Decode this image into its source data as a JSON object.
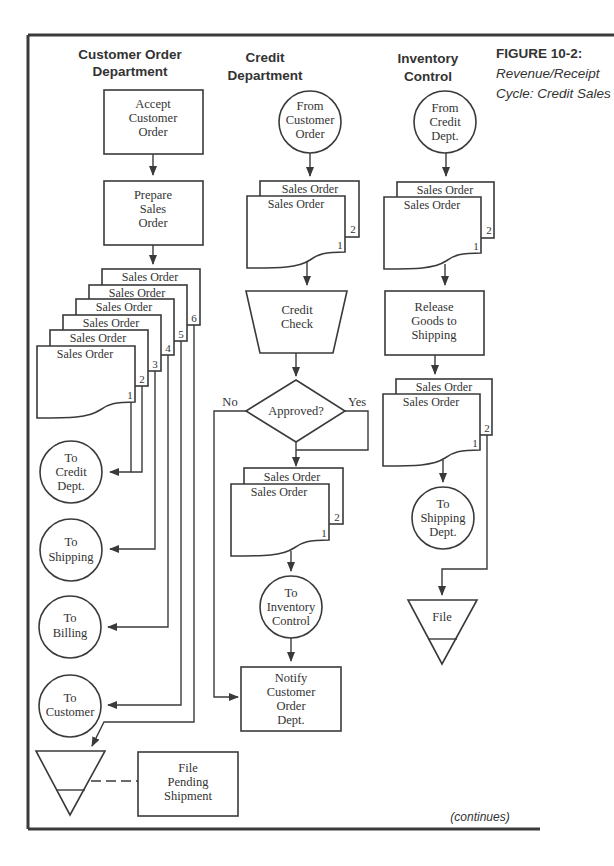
{
  "figure": {
    "number_label": "FIGURE  10-2:",
    "caption_line1": "Revenue/Receipt",
    "caption_line2": "Cycle: Credit Sales",
    "continues_label": "(continues)"
  },
  "columns": {
    "customer_order": {
      "heading_line1": "Customer Order",
      "heading_line2": "Department"
    },
    "credit": {
      "heading_line1": "Credit",
      "heading_line2": "Department"
    },
    "inventory": {
      "heading_line1": "Inventory",
      "heading_line2": "Control"
    }
  },
  "customer_order_dept": {
    "accept": [
      "Accept",
      "Customer",
      "Order"
    ],
    "prepare": [
      "Prepare",
      "Sales",
      "Order"
    ],
    "documents": {
      "label": "Sales Order",
      "copies": [
        "1",
        "2",
        "3",
        "4",
        "5",
        "6"
      ]
    },
    "to_credit": [
      "To",
      "Credit",
      "Dept."
    ],
    "to_shipping": [
      "To",
      "Shipping"
    ],
    "to_billing": [
      "To",
      "Billing"
    ],
    "to_customer": [
      "To",
      "Customer"
    ],
    "file_pending": [
      "File",
      "Pending",
      "Shipment"
    ]
  },
  "credit_dept": {
    "from_customer_order": [
      "From",
      "Customer",
      "Order"
    ],
    "documents": {
      "label": "Sales Order",
      "copies": [
        "1",
        "2"
      ]
    },
    "credit_check": [
      "Credit",
      "Check"
    ],
    "decision": "Approved?",
    "no_label": "No",
    "yes_label": "Yes",
    "documents_after": {
      "label": "Sales Order",
      "copies": [
        "1",
        "2"
      ]
    },
    "to_inventory": [
      "To",
      "Inventory",
      "Control"
    ],
    "notify": [
      "Notify",
      "Customer",
      "Order",
      "Dept."
    ]
  },
  "inventory_control": {
    "from_credit": [
      "From",
      "Credit",
      "Dept."
    ],
    "documents": {
      "label": "Sales Order",
      "copies": [
        "1",
        "2"
      ]
    },
    "release": [
      "Release",
      "Goods to",
      "Shipping"
    ],
    "documents_after": {
      "label": "Sales Order",
      "copies": [
        "1",
        "2"
      ]
    },
    "to_shipping_dept": [
      "To",
      "Shipping",
      "Dept."
    ],
    "file": "File"
  },
  "colors": {
    "ink": "#3a3a3a",
    "background": "#ffffff"
  }
}
